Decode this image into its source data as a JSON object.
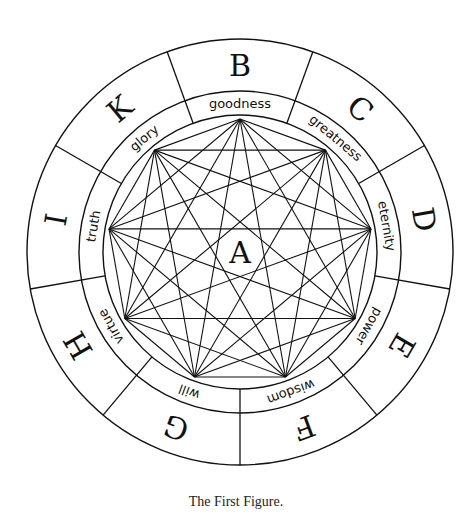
{
  "figure": {
    "title_center": "A",
    "caption": "The First Figure.",
    "stroke_color": "#111111",
    "background": "#ffffff",
    "geometry": {
      "cx": 240,
      "cy": 252,
      "r_outer": 213,
      "r_middle": 161,
      "r_inner": 137,
      "r_vertex": 133,
      "start_angle_deg": -90,
      "step_deg": 40
    },
    "letters": [
      "B",
      "C",
      "D",
      "E",
      "F",
      "G",
      "H",
      "I",
      "K"
    ],
    "attributes": [
      "goodness",
      "greatness",
      "eternity",
      "power",
      "wisdom",
      "will",
      "virtue",
      "truth",
      "glory"
    ]
  }
}
